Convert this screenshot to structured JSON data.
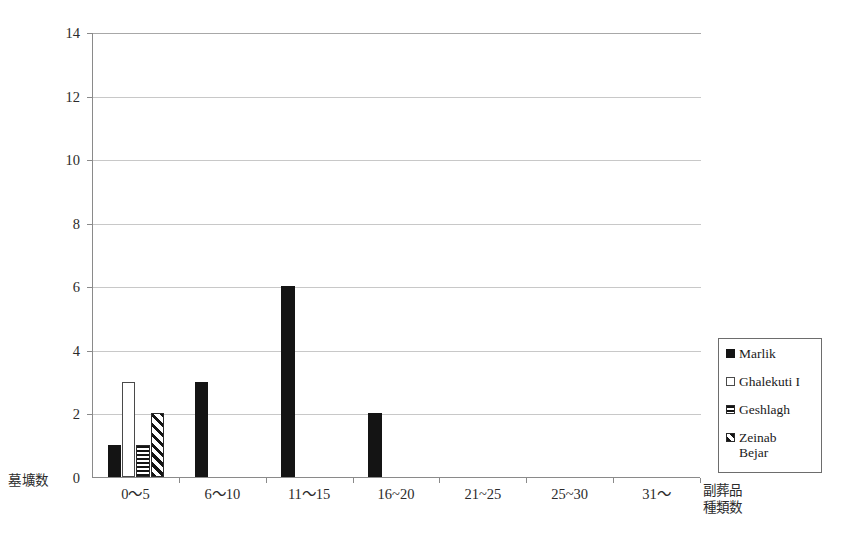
{
  "chart_data": {
    "type": "bar",
    "title": "",
    "xlabel": "副葬品種類数",
    "ylabel": "墓壙数",
    "ylim": [
      0,
      14
    ],
    "ytick_step": 2,
    "yticks": [
      "0",
      "2",
      "4",
      "6",
      "8",
      "10",
      "12",
      "14"
    ],
    "grid": "horizontal",
    "legend_position": "right",
    "categories": [
      "0〜5",
      "6〜10",
      "11〜15",
      "16~20",
      "21~25",
      "25~30",
      "31〜"
    ],
    "series": [
      {
        "name": "Marlik",
        "pattern": "solid",
        "values": [
          1,
          3,
          6,
          2,
          0,
          0,
          0
        ]
      },
      {
        "name": "Ghalekuti I",
        "pattern": "empty",
        "values": [
          3,
          0,
          0,
          0,
          0,
          0,
          0
        ]
      },
      {
        "name": "Geshlagh",
        "pattern": "hstripe",
        "values": [
          1,
          0,
          0,
          0,
          0,
          0,
          0
        ]
      },
      {
        "name": "Zeinab Bejar",
        "pattern": "dstripe",
        "values": [
          2,
          0,
          0,
          0,
          0,
          0,
          0
        ]
      }
    ]
  },
  "legend": {
    "items": [
      {
        "label": "Marlik",
        "pattern": "solid"
      },
      {
        "label": "Ghalekuti I",
        "pattern": "empty"
      },
      {
        "label": "Geshlagh",
        "pattern": "hstripe"
      },
      {
        "label": "Zeinab Bejar",
        "pattern": "dstripe"
      }
    ]
  },
  "axes": {
    "y_axis_title": "墓壙数",
    "x_axis_title_line1": "副葬品",
    "x_axis_title_line2": "種類数"
  },
  "caption": ""
}
